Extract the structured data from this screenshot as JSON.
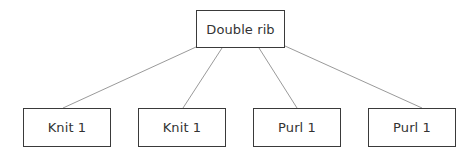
{
  "diagram": {
    "type": "tree",
    "root": {
      "label": "Double rib",
      "x": 196,
      "y": 10,
      "w": 89,
      "h": 38
    },
    "children": [
      {
        "label": "Knit 1",
        "x": 23,
        "y": 108,
        "w": 88,
        "h": 39
      },
      {
        "label": "Knit 1",
        "x": 138,
        "y": 108,
        "w": 88,
        "h": 39
      },
      {
        "label": "Purl 1",
        "x": 253,
        "y": 108,
        "w": 88,
        "h": 39
      },
      {
        "label": "Purl 1",
        "x": 368,
        "y": 108,
        "w": 88,
        "h": 39
      }
    ],
    "edges": [
      {
        "from": [
          196,
          47
        ],
        "to": [
          63,
          108
        ]
      },
      {
        "from": [
          222,
          48
        ],
        "to": [
          183,
          108
        ]
      },
      {
        "from": [
          259,
          48
        ],
        "to": [
          297,
          108
        ]
      },
      {
        "from": [
          285,
          46
        ],
        "to": [
          422,
          108
        ]
      }
    ],
    "colors": {
      "border": "#3a3a3a",
      "edge": "#9a9a9a",
      "text": "#333333",
      "background": "#ffffff"
    }
  }
}
